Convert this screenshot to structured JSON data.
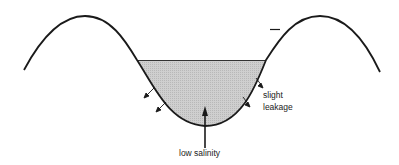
{
  "diagram": {
    "labels": {
      "bottom": "low salinity",
      "side_line1": "slight",
      "side_line2": "leakage"
    },
    "colors": {
      "line": "#1a1a1a",
      "fill": "#c8c8c8",
      "background": "#ffffff"
    }
  }
}
